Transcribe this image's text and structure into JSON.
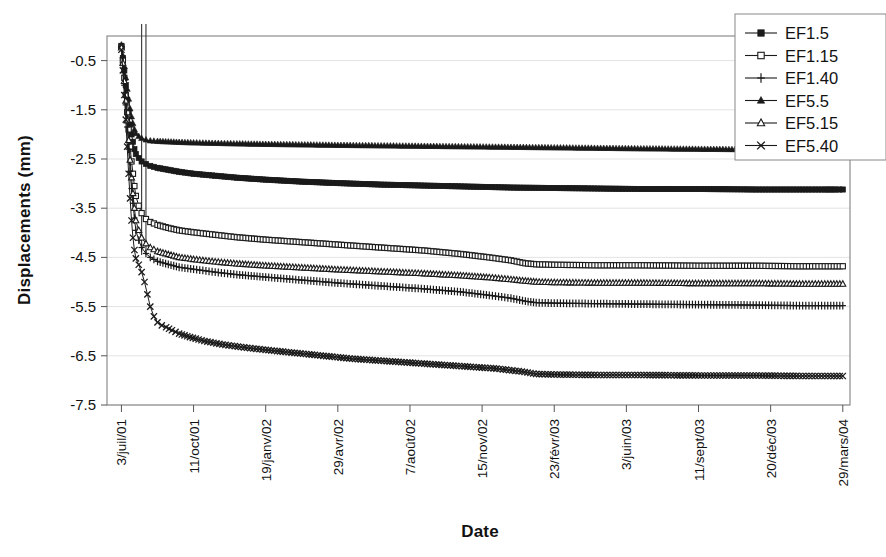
{
  "chart_data": {
    "type": "line",
    "title": "",
    "xlabel": "Date",
    "ylabel": "Displacements (mm)",
    "ylim": [
      -7.5,
      0.0
    ],
    "yticks": [
      "-0.5",
      "-1.5",
      "-2.5",
      "-3.5",
      "-4.5",
      "-5.5",
      "-6.5",
      "-7.5"
    ],
    "ytick_values": [
      -0.5,
      -1.5,
      -2.5,
      -3.5,
      -4.5,
      -5.5,
      -6.5,
      -7.5
    ],
    "xtick_labels": [
      "3/juil/01",
      "11/oct/01",
      "19/janv/02",
      "29/avr/02",
      "7/août/02",
      "15/nov/02",
      "23/févr/03",
      "3/juin/03",
      "11/sept/03",
      "20/déc/03",
      "29/mars/04"
    ],
    "xtick_days": [
      0,
      100,
      200,
      300,
      400,
      500,
      600,
      700,
      800,
      900,
      1000
    ],
    "xlim_days": [
      -20,
      1010
    ],
    "grid": true,
    "legend_position": "top-right",
    "series": [
      {
        "name": "EF1.5",
        "marker": "filled-square",
        "points": [
          [
            0,
            -0.2
          ],
          [
            2,
            -0.45
          ],
          [
            4,
            -0.7
          ],
          [
            6,
            -1.0
          ],
          [
            8,
            -1.3
          ],
          [
            10,
            -1.55
          ],
          [
            12,
            -1.8
          ],
          [
            14,
            -2.0
          ],
          [
            16,
            -2.15
          ],
          [
            18,
            -2.3
          ],
          [
            20,
            -2.4
          ],
          [
            24,
            -2.48
          ],
          [
            28,
            -2.55
          ],
          [
            34,
            -2.6
          ],
          [
            40,
            -2.64
          ],
          [
            50,
            -2.68
          ],
          [
            65,
            -2.72
          ],
          [
            80,
            -2.76
          ],
          [
            100,
            -2.8
          ],
          [
            130,
            -2.84
          ],
          [
            160,
            -2.88
          ],
          [
            200,
            -2.92
          ],
          [
            250,
            -2.96
          ],
          [
            300,
            -2.99
          ],
          [
            360,
            -3.02
          ],
          [
            420,
            -3.04
          ],
          [
            480,
            -3.06
          ],
          [
            540,
            -3.08
          ],
          [
            600,
            -3.09
          ],
          [
            660,
            -3.1
          ],
          [
            720,
            -3.11
          ],
          [
            800,
            -3.11
          ],
          [
            880,
            -3.12
          ],
          [
            940,
            -3.12
          ],
          [
            975,
            -3.12
          ],
          [
            990,
            -3.12
          ],
          [
            1000,
            -3.12
          ]
        ]
      },
      {
        "name": "EF1.15",
        "marker": "open-square",
        "points": [
          [
            0,
            -0.22
          ],
          [
            2,
            -0.5
          ],
          [
            4,
            -0.85
          ],
          [
            6,
            -1.2
          ],
          [
            8,
            -1.55
          ],
          [
            10,
            -1.9
          ],
          [
            12,
            -2.25
          ],
          [
            14,
            -2.55
          ],
          [
            16,
            -2.8
          ],
          [
            18,
            -3.05
          ],
          [
            20,
            -3.25
          ],
          [
            24,
            -3.45
          ],
          [
            28,
            -3.6
          ],
          [
            34,
            -3.72
          ],
          [
            40,
            -3.78
          ],
          [
            50,
            -3.84
          ],
          [
            65,
            -3.9
          ],
          [
            80,
            -3.95
          ],
          [
            100,
            -3.99
          ],
          [
            130,
            -4.04
          ],
          [
            160,
            -4.09
          ],
          [
            200,
            -4.14
          ],
          [
            250,
            -4.19
          ],
          [
            300,
            -4.24
          ],
          [
            360,
            -4.3
          ],
          [
            420,
            -4.36
          ],
          [
            470,
            -4.43
          ],
          [
            510,
            -4.5
          ],
          [
            540,
            -4.56
          ],
          [
            560,
            -4.62
          ],
          [
            575,
            -4.64
          ],
          [
            600,
            -4.65
          ],
          [
            660,
            -4.66
          ],
          [
            720,
            -4.66
          ],
          [
            800,
            -4.67
          ],
          [
            880,
            -4.67
          ],
          [
            940,
            -4.68
          ],
          [
            975,
            -4.68
          ],
          [
            1000,
            -4.68
          ]
        ]
      },
      {
        "name": "EF1.40",
        "marker": "plus",
        "points": [
          [
            0,
            -0.25
          ],
          [
            2,
            -0.6
          ],
          [
            4,
            -1.0
          ],
          [
            6,
            -1.4
          ],
          [
            8,
            -1.85
          ],
          [
            10,
            -2.3
          ],
          [
            12,
            -2.75
          ],
          [
            14,
            -3.1
          ],
          [
            16,
            -3.4
          ],
          [
            18,
            -3.7
          ],
          [
            20,
            -3.95
          ],
          [
            24,
            -4.15
          ],
          [
            28,
            -4.3
          ],
          [
            34,
            -4.42
          ],
          [
            40,
            -4.5
          ],
          [
            50,
            -4.58
          ],
          [
            65,
            -4.64
          ],
          [
            80,
            -4.7
          ],
          [
            100,
            -4.74
          ],
          [
            130,
            -4.8
          ],
          [
            160,
            -4.85
          ],
          [
            200,
            -4.9
          ],
          [
            250,
            -4.96
          ],
          [
            300,
            -5.02
          ],
          [
            360,
            -5.08
          ],
          [
            420,
            -5.14
          ],
          [
            470,
            -5.2
          ],
          [
            510,
            -5.27
          ],
          [
            540,
            -5.33
          ],
          [
            560,
            -5.39
          ],
          [
            575,
            -5.42
          ],
          [
            600,
            -5.43
          ],
          [
            660,
            -5.44
          ],
          [
            720,
            -5.45
          ],
          [
            800,
            -5.46
          ],
          [
            880,
            -5.47
          ],
          [
            940,
            -5.48
          ],
          [
            975,
            -5.48
          ],
          [
            1000,
            -5.48
          ]
        ]
      },
      {
        "name": "EF5.5",
        "marker": "filled-triangle",
        "points": [
          [
            0,
            -0.18
          ],
          [
            2,
            -0.4
          ],
          [
            4,
            -0.62
          ],
          [
            6,
            -0.85
          ],
          [
            8,
            -1.08
          ],
          [
            10,
            -1.28
          ],
          [
            12,
            -1.48
          ],
          [
            14,
            -1.64
          ],
          [
            16,
            -1.78
          ],
          [
            18,
            -1.9
          ],
          [
            20,
            -1.98
          ],
          [
            24,
            -2.04
          ],
          [
            28,
            -2.08
          ],
          [
            34,
            -2.11
          ],
          [
            40,
            -2.13
          ],
          [
            50,
            -2.14
          ],
          [
            65,
            -2.15
          ],
          [
            80,
            -2.16
          ],
          [
            100,
            -2.17
          ],
          [
            130,
            -2.18
          ],
          [
            160,
            -2.19
          ],
          [
            200,
            -2.2
          ],
          [
            250,
            -2.21
          ],
          [
            300,
            -2.22
          ],
          [
            360,
            -2.23
          ],
          [
            420,
            -2.24
          ],
          [
            480,
            -2.25
          ],
          [
            540,
            -2.26
          ],
          [
            600,
            -2.27
          ],
          [
            660,
            -2.28
          ],
          [
            720,
            -2.29
          ],
          [
            800,
            -2.3
          ],
          [
            880,
            -2.31
          ],
          [
            940,
            -2.32
          ],
          [
            975,
            -2.32
          ],
          [
            1000,
            -2.33
          ]
        ]
      },
      {
        "name": "EF5.15",
        "marker": "open-triangle",
        "points": [
          [
            0,
            -0.24
          ],
          [
            2,
            -0.55
          ],
          [
            4,
            -0.92
          ],
          [
            6,
            -1.32
          ],
          [
            8,
            -1.72
          ],
          [
            10,
            -2.12
          ],
          [
            12,
            -2.52
          ],
          [
            14,
            -2.88
          ],
          [
            16,
            -3.2
          ],
          [
            18,
            -3.5
          ],
          [
            20,
            -3.75
          ],
          [
            24,
            -3.95
          ],
          [
            28,
            -4.1
          ],
          [
            34,
            -4.22
          ],
          [
            40,
            -4.3
          ],
          [
            50,
            -4.38
          ],
          [
            65,
            -4.44
          ],
          [
            80,
            -4.5
          ],
          [
            100,
            -4.54
          ],
          [
            130,
            -4.59
          ],
          [
            160,
            -4.63
          ],
          [
            200,
            -4.67
          ],
          [
            250,
            -4.71
          ],
          [
            300,
            -4.75
          ],
          [
            360,
            -4.79
          ],
          [
            420,
            -4.83
          ],
          [
            470,
            -4.87
          ],
          [
            510,
            -4.91
          ],
          [
            540,
            -4.95
          ],
          [
            560,
            -4.98
          ],
          [
            575,
            -5.0
          ],
          [
            600,
            -5.01
          ],
          [
            660,
            -5.02
          ],
          [
            720,
            -5.02
          ],
          [
            800,
            -5.03
          ],
          [
            880,
            -5.03
          ],
          [
            940,
            -5.04
          ],
          [
            975,
            -5.04
          ],
          [
            1000,
            -5.04
          ]
        ]
      },
      {
        "name": "EF5.40",
        "marker": "cross",
        "points": [
          [
            0,
            -0.28
          ],
          [
            2,
            -0.7
          ],
          [
            4,
            -1.2
          ],
          [
            6,
            -1.7
          ],
          [
            8,
            -2.25
          ],
          [
            10,
            -2.8
          ],
          [
            12,
            -3.3
          ],
          [
            14,
            -3.75
          ],
          [
            16,
            -4.1
          ],
          [
            18,
            -4.35
          ],
          [
            20,
            -4.52
          ],
          [
            24,
            -4.65
          ],
          [
            28,
            -4.8
          ],
          [
            32,
            -5.0
          ],
          [
            36,
            -5.25
          ],
          [
            40,
            -5.5
          ],
          [
            45,
            -5.7
          ],
          [
            50,
            -5.82
          ],
          [
            56,
            -5.88
          ],
          [
            62,
            -5.92
          ],
          [
            70,
            -5.98
          ],
          [
            80,
            -6.05
          ],
          [
            95,
            -6.12
          ],
          [
            115,
            -6.2
          ],
          [
            140,
            -6.27
          ],
          [
            170,
            -6.33
          ],
          [
            200,
            -6.38
          ],
          [
            240,
            -6.44
          ],
          [
            280,
            -6.5
          ],
          [
            320,
            -6.56
          ],
          [
            360,
            -6.6
          ],
          [
            400,
            -6.64
          ],
          [
            440,
            -6.68
          ],
          [
            480,
            -6.72
          ],
          [
            520,
            -6.76
          ],
          [
            555,
            -6.82
          ],
          [
            575,
            -6.87
          ],
          [
            600,
            -6.88
          ],
          [
            660,
            -6.89
          ],
          [
            720,
            -6.89
          ],
          [
            800,
            -6.9
          ],
          [
            880,
            -6.9
          ],
          [
            940,
            -6.91
          ],
          [
            975,
            -6.91
          ],
          [
            1000,
            -6.91
          ]
        ]
      }
    ],
    "vertical_markers": [
      28,
      34
    ]
  },
  "legend": {
    "items": [
      {
        "label": "EF1.5"
      },
      {
        "label": "EF1.15"
      },
      {
        "label": "EF1.40"
      },
      {
        "label": "EF5.5"
      },
      {
        "label": "EF5.15"
      },
      {
        "label": "EF5.40"
      }
    ]
  },
  "colors": {
    "line": "#1a1a1a",
    "grid": "#e3e3e3",
    "axis": "#555555",
    "background": "#ffffff",
    "text": "#111111"
  }
}
